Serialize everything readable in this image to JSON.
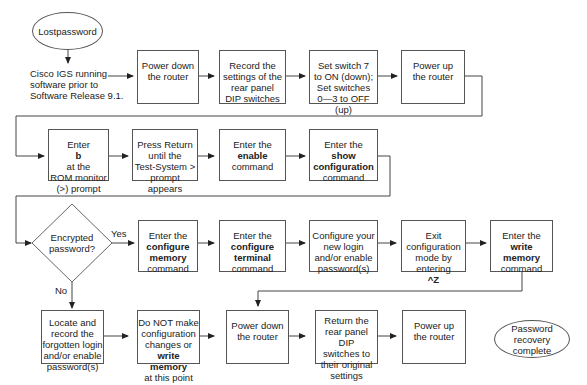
{
  "diagram": {
    "type": "flowchart",
    "start": {
      "lines": [
        "Lost",
        "password"
      ]
    },
    "note": {
      "lines": [
        "Cisco IGS running",
        "software prior to",
        "Software Release 9.1."
      ]
    },
    "row1": [
      {
        "id": "power_down_1",
        "lines": [
          "Power down",
          "the router"
        ]
      },
      {
        "id": "record_dip",
        "lines": [
          "Record the",
          "settings of the",
          "rear panel",
          "DIP switches"
        ]
      },
      {
        "id": "set_switch",
        "lines": [
          "Set switch 7",
          "to ON (down);",
          "Set switches",
          "0—3 to OFF (up)"
        ]
      },
      {
        "id": "power_up_1",
        "lines": [
          "Power up",
          "the router"
        ]
      }
    ],
    "row2": [
      {
        "id": "enter_b",
        "pre": "Enter ",
        "bold": "b",
        "post": " at the",
        "lines": [
          "ROM monitor",
          "(>) prompt"
        ]
      },
      {
        "id": "press_return",
        "lines": [
          "Press Return",
          "until the",
          "Test-System >",
          "prompt appears"
        ]
      },
      {
        "id": "enable",
        "lines": [
          "Enter the"
        ],
        "bold_lines": [
          "enable"
        ],
        "tail": [
          "command"
        ]
      },
      {
        "id": "show_config",
        "lines": [
          "Enter the"
        ],
        "bold_lines": [
          "show",
          "configuration"
        ],
        "tail": [
          "command"
        ]
      }
    ],
    "decision": {
      "lines": [
        "Encrypted",
        "password?"
      ],
      "yes_label": "Yes",
      "no_label": "No"
    },
    "row3": [
      {
        "id": "configure_memory",
        "lines": [
          "Enter the"
        ],
        "bold_lines": [
          "configure",
          "memory"
        ],
        "tail": [
          "command"
        ]
      },
      {
        "id": "configure_terminal",
        "lines": [
          "Enter the"
        ],
        "bold_lines": [
          "configure",
          "terminal"
        ],
        "tail": [
          "command"
        ]
      },
      {
        "id": "configure_login",
        "lines": [
          "Configure your",
          "new login",
          "and/or enable",
          "password(s)"
        ]
      },
      {
        "id": "exit_config",
        "lines": [
          "Exit",
          "configuration",
          "mode by entering"
        ],
        "bold_lines": [
          "^Z"
        ]
      },
      {
        "id": "write_memory",
        "lines": [
          "Enter the"
        ],
        "bold_lines": [
          "write",
          "memory"
        ],
        "tail": [
          "command"
        ]
      }
    ],
    "row4": [
      {
        "id": "locate_record",
        "lines": [
          "Locate and",
          "record the",
          "forgotten login",
          "and/or enable",
          "password(s)"
        ]
      },
      {
        "id": "do_not",
        "lines": [
          "Do NOT make",
          "configuration",
          "changes or"
        ],
        "bold_lines": [
          "write memory"
        ],
        "tail": [
          "at this point"
        ]
      },
      {
        "id": "power_down_2",
        "lines": [
          "Power down",
          "the router"
        ]
      },
      {
        "id": "return_dip",
        "lines": [
          "Return the",
          "rear panel DIP",
          "switches to",
          "their original",
          "settings"
        ]
      },
      {
        "id": "power_up_2",
        "lines": [
          "Power up",
          "the router"
        ]
      }
    ],
    "end": {
      "lines": [
        "Password",
        "recovery",
        "complete"
      ]
    }
  }
}
